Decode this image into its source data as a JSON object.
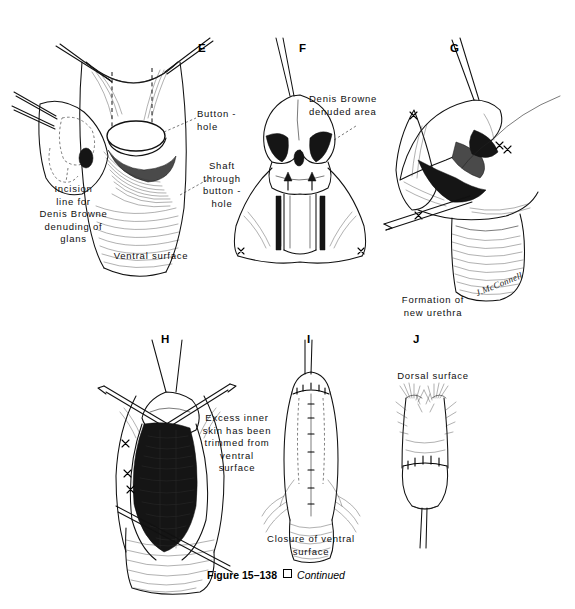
{
  "figure": {
    "number_label": "Figure 15–138",
    "separator_symbol": "□",
    "continued_label": "Continued",
    "artist_signature": "J.McConnell"
  },
  "panels": [
    {
      "letter": "E",
      "captions": [
        {
          "name": "button-hole",
          "text": "Button -\nhole"
        },
        {
          "name": "shaft-through-button-hole",
          "text": "Shaft\nthrough\nbutton -\nhole"
        },
        {
          "name": "incision-line",
          "text": "Incision\nline for\nDenis Browne\ndenuding of\nglans"
        },
        {
          "name": "ventral-surface",
          "text": "Ventral  surface"
        }
      ]
    },
    {
      "letter": "F",
      "captions": [
        {
          "name": "denuded-area",
          "text": "Denis Browne\ndenuded area"
        }
      ]
    },
    {
      "letter": "G",
      "captions": [
        {
          "name": "new-urethra",
          "text": "Formation of\nnew urethra"
        }
      ]
    },
    {
      "letter": "H",
      "captions": [
        {
          "name": "excess-skin-trimmed",
          "text": "Excess inner\nskin has been\ntrimmed from\nventral\nsurface"
        }
      ]
    },
    {
      "letter": "I",
      "captions": [
        {
          "name": "closure-of-ventral-surface",
          "text": "Closure of ventral\nsurface"
        }
      ]
    },
    {
      "letter": "J",
      "captions": [
        {
          "name": "dorsal-surface",
          "text": "Dorsal  surface"
        }
      ]
    }
  ],
  "colors": {
    "background": "#ffffff",
    "ink": "#111111",
    "shade_dark": "#151515",
    "shade_mid": "#4a4a4a"
  }
}
